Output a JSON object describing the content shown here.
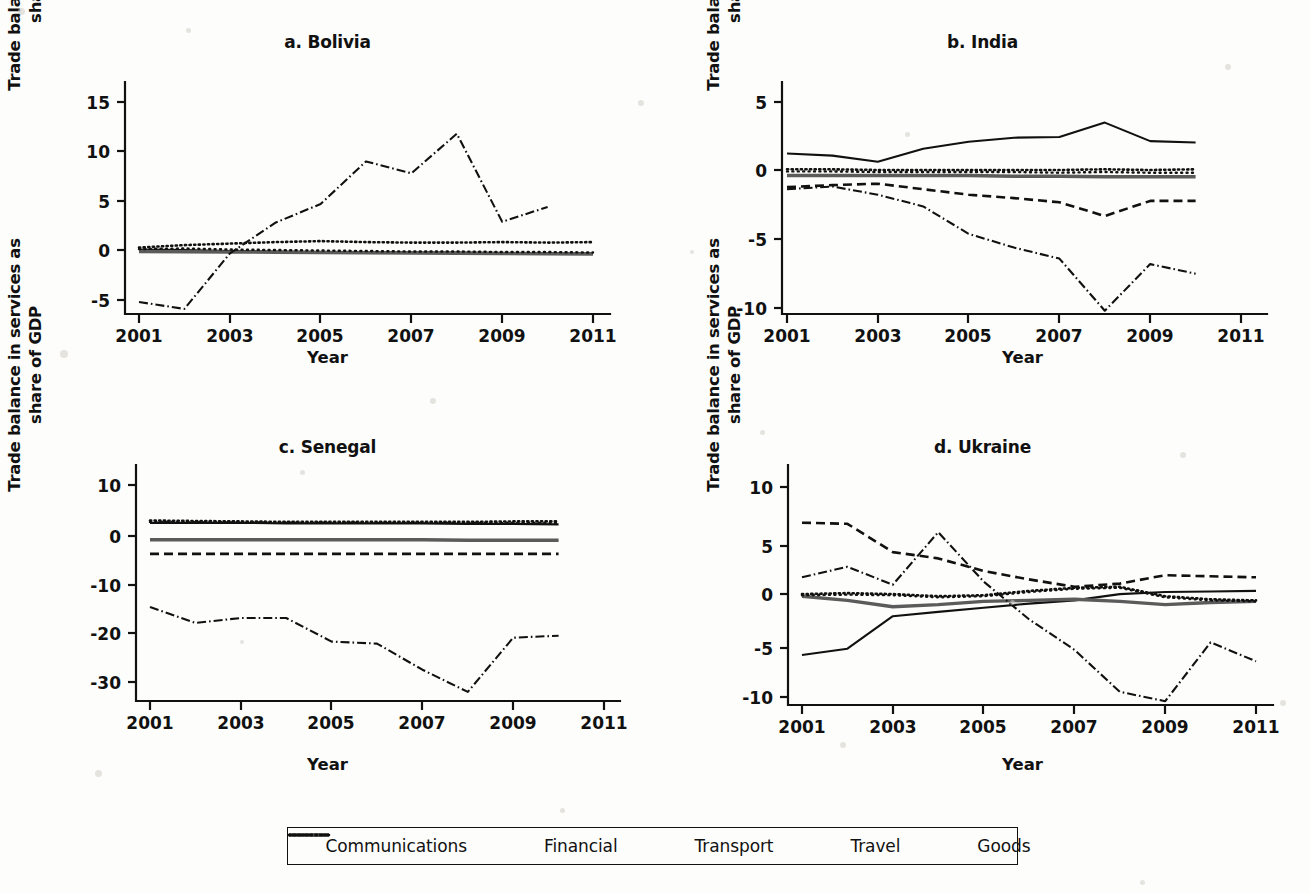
{
  "figure": {
    "axis_label_y": "Trade balance in services as share of GDP",
    "axis_label_y_line1": "Trade balance in services as",
    "axis_label_y_line2": "share of GDP",
    "axis_label_x": "Year"
  },
  "legend": {
    "position": "bottom-center",
    "items": [
      {
        "label": "Communications",
        "style": "solid",
        "icon": "solid-line-icon"
      },
      {
        "label": "Financial",
        "style": "thick-gray-solid",
        "icon": "thick-line-icon"
      },
      {
        "label": "Transport",
        "style": "dotted-dense",
        "icon": "dotted-line-icon"
      },
      {
        "label": "Travel",
        "style": "dotted-sparse",
        "icon": "dotted-line-icon"
      },
      {
        "label": "Goods",
        "style": "dash-dot",
        "icon": "dash-dot-line-icon"
      }
    ]
  },
  "chart_data": [
    {
      "type": "line",
      "panel": "a",
      "title": "a. Bolivia",
      "xlabel": "Year",
      "ylabel": "Trade balance in services as share of GDP",
      "grid": false,
      "xlim": [
        2001,
        2011
      ],
      "ylim": [
        -7.0,
        16.5
      ],
      "xticks": [
        2001,
        2003,
        2005,
        2007,
        2009,
        2011
      ],
      "xticklabels": [
        "2001",
        "2003",
        "2005",
        "2007",
        "2009",
        "2011"
      ],
      "yticks": [
        -5,
        0,
        5,
        10,
        15
      ],
      "yticklabels": [
        "-5",
        "0",
        "5",
        "10",
        "15"
      ],
      "x": [
        2001,
        2002,
        2003,
        2004,
        2005,
        2006,
        2007,
        2008,
        2009,
        2010,
        2011
      ],
      "series": [
        {
          "name": "Communications",
          "style": "solid",
          "values": [
            0.1,
            0.05,
            -0.05,
            -0.1,
            -0.15,
            -0.2,
            -0.2,
            -0.2,
            -0.25,
            -0.3,
            -0.3
          ]
        },
        {
          "name": "Financial",
          "style": "thick-gray-solid",
          "values": [
            -0.1,
            -0.12,
            -0.15,
            -0.18,
            -0.2,
            -0.22,
            -0.25,
            -0.28,
            -0.3,
            -0.33,
            -0.35
          ]
        },
        {
          "name": "Transport",
          "style": "dotted-dense",
          "values": [
            0.3,
            0.55,
            0.7,
            0.85,
            0.95,
            0.85,
            0.8,
            0.8,
            0.85,
            0.8,
            0.85
          ]
        },
        {
          "name": "Travel",
          "style": "dotted-sparse",
          "values": [
            0.15,
            0.2,
            0.1,
            0.05,
            0.0,
            -0.05,
            -0.1,
            -0.1,
            -0.15,
            -0.15,
            -0.2
          ]
        },
        {
          "name": "Goods",
          "style": "dash-dot",
          "values": [
            -5.2,
            -5.9,
            -0.3,
            2.8,
            4.7,
            9.0,
            7.8,
            11.8,
            2.9,
            4.4,
            null
          ]
        }
      ]
    },
    {
      "type": "line",
      "panel": "b",
      "title": "b. India",
      "xlabel": "Year",
      "ylabel": "Trade balance in services as share of GDP",
      "grid": false,
      "xlim": [
        2001,
        2011
      ],
      "ylim": [
        -11.5,
        6.0
      ],
      "xticks": [
        2001,
        2003,
        2005,
        2007,
        2009,
        2011
      ],
      "xticklabels": [
        "2001",
        "2003",
        "2005",
        "2007",
        "2009",
        "2011"
      ],
      "yticks": [
        -10,
        -5,
        0,
        5
      ],
      "yticklabels": [
        "-10",
        "-5",
        "0",
        "5"
      ],
      "x": [
        2001,
        2002,
        2003,
        2004,
        2005,
        2006,
        2007,
        2008,
        2009,
        2010
      ],
      "series": [
        {
          "name": "Communications",
          "style": "solid",
          "values": [
            1.25,
            1.1,
            0.65,
            1.6,
            2.1,
            2.4,
            2.45,
            3.5,
            2.15,
            2.05
          ]
        },
        {
          "name": "Financial",
          "style": "thick-gray-solid",
          "values": [
            -0.35,
            -0.35,
            -0.35,
            -0.35,
            -0.35,
            -0.4,
            -0.4,
            -0.45,
            -0.45,
            -0.45
          ]
        },
        {
          "name": "Transport",
          "style": "dotted-dense",
          "values": [
            0.1,
            0.1,
            0.05,
            0.05,
            0.05,
            0.05,
            0.05,
            0.1,
            0.05,
            0.1
          ]
        },
        {
          "name": "Travel",
          "style": "dotted-sparse",
          "values": [
            -0.05,
            -0.05,
            -0.1,
            -0.1,
            -0.1,
            -0.1,
            -0.15,
            -0.1,
            -0.15,
            -0.15
          ]
        },
        {
          "name": "Transport-dash",
          "style": "dashed",
          "values": [
            -1.2,
            -1.05,
            -0.95,
            -1.35,
            -1.75,
            -2.0,
            -2.3,
            -3.3,
            -2.2,
            -2.2
          ]
        },
        {
          "name": "Goods",
          "style": "dash-dot",
          "values": [
            -1.35,
            -1.15,
            -1.75,
            -2.6,
            -4.6,
            -5.6,
            -6.4,
            -10.2,
            -6.8,
            -7.5
          ]
        }
      ]
    },
    {
      "type": "line",
      "panel": "c",
      "title": "c. Senegal",
      "xlabel": "Year",
      "ylabel": "Trade balance in services as share of GDP",
      "grid": false,
      "xlim": [
        2001,
        2011
      ],
      "ylim": [
        -35.0,
        13.5
      ],
      "xticks": [
        2001,
        2003,
        2005,
        2007,
        2009,
        2011
      ],
      "xticklabels": [
        "2001",
        "2003",
        "2005",
        "2007",
        "2009",
        "2011"
      ],
      "yticks": [
        -30,
        -20,
        -10,
        0,
        10
      ],
      "yticklabels": [
        "-30",
        "-20",
        "-10",
        "0",
        "10"
      ],
      "x": [
        2001,
        2002,
        2003,
        2004,
        2005,
        2006,
        2007,
        2008,
        2009,
        2010
      ],
      "series": [
        {
          "name": "Communications",
          "style": "solid",
          "values": [
            2.3,
            2.3,
            2.3,
            2.2,
            2.2,
            2.2,
            2.2,
            2.1,
            2.1,
            2.0
          ]
        },
        {
          "name": "Financial",
          "style": "thick-gray-solid",
          "values": [
            -1.1,
            -1.1,
            -1.1,
            -1.1,
            -1.1,
            -1.1,
            -1.1,
            -1.2,
            -1.2,
            -1.2
          ]
        },
        {
          "name": "Transport",
          "style": "dotted-dense",
          "values": [
            2.8,
            2.7,
            2.6,
            2.5,
            2.5,
            2.5,
            2.5,
            2.5,
            2.6,
            2.6
          ]
        },
        {
          "name": "Travel",
          "style": "dotted-sparse",
          "values": [
            2.5,
            2.45,
            2.4,
            2.35,
            2.35,
            2.3,
            2.3,
            2.3,
            2.3,
            2.3
          ]
        },
        {
          "name": "Transport-dash",
          "style": "dashed",
          "values": [
            -4.0,
            -4.0,
            -4.0,
            -4.0,
            -4.0,
            -4.0,
            -4.0,
            -4.0,
            -4.0,
            -4.0
          ]
        },
        {
          "name": "Goods",
          "style": "dash-dot",
          "values": [
            -14.8,
            -18.0,
            -17.0,
            -17.0,
            -21.8,
            -22.2,
            -27.5,
            -32.0,
            -21.0,
            -20.6
          ]
        }
      ]
    },
    {
      "type": "line",
      "panel": "d",
      "title": "d. Ukraine",
      "xlabel": "Year",
      "ylabel": "Trade balance in services as share of GDP",
      "grid": false,
      "xlim": [
        2001,
        2011
      ],
      "ylim": [
        -12.0,
        12.0
      ],
      "xticks": [
        2001,
        2003,
        2005,
        2007,
        2009,
        2011
      ],
      "xticklabels": [
        "2001",
        "2003",
        "2005",
        "2007",
        "2009",
        "2011"
      ],
      "yticks": [
        -10,
        -5,
        0,
        5,
        10
      ],
      "yticklabels": [
        "-10",
        "-5",
        "0",
        "5",
        "10"
      ],
      "x": [
        2001,
        2002,
        2003,
        2004,
        2005,
        2006,
        2007,
        2008,
        2009,
        2010,
        2011
      ],
      "series": [
        {
          "name": "Communications",
          "style": "solid",
          "values": [
            -6.0,
            -5.4,
            -2.3,
            -1.9,
            -1.5,
            -1.1,
            -0.8,
            -0.2,
            0.0,
            0.05,
            0.1
          ]
        },
        {
          "name": "Financial",
          "style": "thick-gray-solid",
          "values": [
            -0.4,
            -0.8,
            -1.4,
            -1.2,
            -0.9,
            -0.8,
            -0.7,
            -0.9,
            -1.2,
            -1.0,
            -0.9
          ]
        },
        {
          "name": "Transport",
          "style": "dotted-dense",
          "values": [
            -0.2,
            -0.1,
            -0.2,
            -0.4,
            -0.3,
            0.1,
            0.4,
            0.5,
            -0.4,
            -0.7,
            -0.8
          ]
        },
        {
          "name": "Travel",
          "style": "dotted-sparse",
          "values": [
            -0.3,
            -0.25,
            -0.3,
            -0.5,
            -0.4,
            0.0,
            0.3,
            0.4,
            -0.5,
            -0.8,
            -0.9
          ]
        },
        {
          "name": "Transport-dash",
          "style": "dashed",
          "values": [
            6.6,
            6.5,
            3.8,
            3.2,
            2.0,
            1.2,
            0.5,
            0.8,
            1.6,
            1.5,
            1.4
          ]
        },
        {
          "name": "Goods",
          "style": "dash-dot",
          "values": [
            1.4,
            2.4,
            0.7,
            5.7,
            1.0,
            -2.6,
            -5.5,
            -9.5,
            -10.4,
            -4.8,
            -6.6
          ]
        }
      ]
    }
  ]
}
